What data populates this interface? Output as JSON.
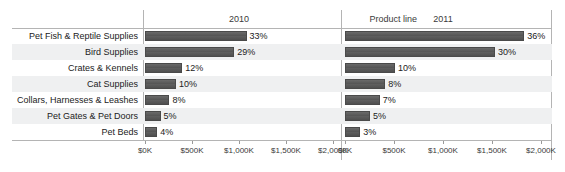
{
  "header": {
    "label_column": "Product line",
    "panels": [
      "2010",
      "2011"
    ]
  },
  "axis": {
    "ticks": [
      "$0K",
      "$500K",
      "$1,000K",
      "$1,500K",
      "$2,000K"
    ],
    "tick_values": [
      0,
      500,
      1000,
      1500,
      2000
    ],
    "min": 0,
    "max": 2000,
    "unit": "K"
  },
  "colors": {
    "bar": "#595959",
    "band": "#eff0f1",
    "rule": "#b4b4b4",
    "text": "#222222"
  },
  "chart_data": {
    "type": "bar",
    "orientation": "horizontal",
    "title": "",
    "xlabel": "",
    "ylabel": "Product line",
    "xlim": [
      0,
      2000
    ],
    "grid": false,
    "legend": "none",
    "panel_field": "Year",
    "categories": [
      "Pet Fish & Reptile Supplies",
      "Bird Supplies",
      "Crates & Kennels",
      "Cat Supplies",
      "Collars, Harnesses & Leashes",
      "Pet Gates & Pet Doors",
      "Pet Beds"
    ],
    "series": [
      {
        "name": "2010",
        "labels": [
          "33%",
          "29%",
          "12%",
          "10%",
          "8%",
          "5%",
          "4%"
        ],
        "percents": [
          33,
          29,
          12,
          10,
          8,
          5,
          4
        ],
        "values": [
          1080,
          950,
          395,
          330,
          260,
          165,
          130
        ]
      },
      {
        "name": "2011",
        "labels": [
          "36%",
          "30%",
          "10%",
          "8%",
          "7%",
          "5%",
          "3%"
        ],
        "percents": [
          36,
          30,
          10,
          8,
          7,
          5,
          3
        ],
        "values": [
          1830,
          1530,
          510,
          410,
          355,
          255,
          155
        ]
      }
    ]
  }
}
